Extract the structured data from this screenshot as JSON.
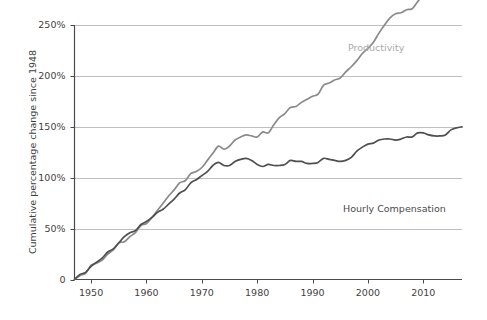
{
  "chart_data": {
    "type": "line",
    "title": "",
    "subtitle": "",
    "xlabel": "",
    "ylabel": "Cumulative percentage change since 1948",
    "xlim": [
      1947,
      2017
    ],
    "ylim": [
      0,
      250
    ],
    "grid": "horizontal",
    "legend_position": "inline-annotation",
    "y_ticks": [
      0,
      50,
      100,
      150,
      200,
      250
    ],
    "y_tick_labels": [
      "0",
      "50%",
      "100%",
      "150%",
      "200%",
      "250%"
    ],
    "x_ticks": [
      1950,
      1960,
      1970,
      1980,
      1990,
      2000,
      2010
    ],
    "x_tick_labels": [
      "1950",
      "1960",
      "1970",
      "1980",
      "1990",
      "2000",
      "2010"
    ],
    "x": [
      1947,
      1948,
      1949,
      1950,
      1951,
      1952,
      1953,
      1954,
      1955,
      1956,
      1957,
      1958,
      1959,
      1960,
      1961,
      1962,
      1963,
      1964,
      1965,
      1966,
      1967,
      1968,
      1969,
      1970,
      1971,
      1972,
      1973,
      1974,
      1975,
      1976,
      1977,
      1978,
      1979,
      1980,
      1981,
      1982,
      1983,
      1984,
      1985,
      1986,
      1987,
      1988,
      1989,
      1990,
      1991,
      1992,
      1993,
      1994,
      1995,
      1996,
      1997,
      1998,
      1999,
      2000,
      2001,
      2002,
      2003,
      2004,
      2005,
      2006,
      2007,
      2008,
      2009,
      2010,
      2011,
      2012,
      2013,
      2014,
      2015,
      2016,
      2017
    ],
    "series": [
      {
        "name": "Productivity",
        "color": "#8a8a8a",
        "label_color": "#a9a9a9",
        "label_x": 2001,
        "label_y": 228,
        "values": [
          0,
          4,
          6,
          14,
          16,
          19,
          25,
          29,
          36,
          37,
          42,
          46,
          53,
          55,
          61,
          68,
          75,
          82,
          88,
          95,
          97,
          104,
          106,
          110,
          117,
          124,
          131,
          128,
          131,
          137,
          140,
          142,
          141,
          140,
          145,
          144,
          152,
          159,
          163,
          169,
          170,
          174,
          177,
          180,
          182,
          191,
          193,
          196,
          198,
          204,
          209,
          215,
          222,
          227,
          233,
          242,
          250,
          257,
          261,
          262,
          265,
          266,
          273,
          279,
          279,
          281,
          282,
          284,
          288,
          289,
          290
        ]
      },
      {
        "name": "Hourly Compensation",
        "color": "#4f4f4f",
        "label_color": "#4a4a4a",
        "label_x": 1993,
        "label_y": 70,
        "values": [
          0,
          5,
          7,
          13,
          17,
          21,
          27,
          30,
          36,
          42,
          46,
          48,
          54,
          57,
          61,
          66,
          69,
          74,
          79,
          85,
          88,
          95,
          98,
          102,
          106,
          112,
          115,
          112,
          112,
          116,
          118,
          119,
          117,
          113,
          111,
          113,
          112,
          112,
          113,
          117,
          116,
          116,
          114,
          114,
          115,
          119,
          118,
          117,
          116,
          117,
          120,
          126,
          130,
          133,
          134,
          137,
          138,
          138,
          137,
          138,
          140,
          140,
          144,
          144,
          142,
          141,
          141,
          142,
          147,
          149,
          150
        ]
      }
    ],
    "notes": {
      "productivity_end_value": "245%",
      "compensation_end_value": "120%",
      "divergence_start_year": 1973
    }
  },
  "annotations": {
    "productivity_label": "Productivity",
    "compensation_label": "Hourly Compensation"
  },
  "axis": {
    "y_title": "Cumulative percentage change since 1948"
  },
  "colors": {
    "productivity_line": "#8a8a8a",
    "compensation_line": "#4f4f4f",
    "gridline": "#b8b8b8",
    "axis": "#4a4a4a",
    "background": "#ffffff"
  }
}
